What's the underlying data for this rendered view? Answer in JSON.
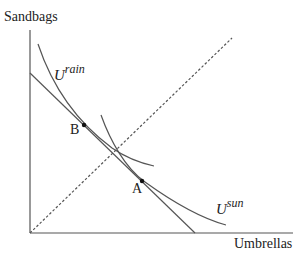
{
  "diagram": {
    "type": "indifference-curve-diagram",
    "axes": {
      "y_label": "Sandbags",
      "x_label": "Umbrellas"
    },
    "curves": [
      {
        "id": "u-rain",
        "label_base": "U",
        "label_sup": "rain"
      },
      {
        "id": "u-sun",
        "label_base": "U",
        "label_sup": "sun"
      }
    ],
    "lines": [
      {
        "id": "budget-line",
        "style": "solid"
      },
      {
        "id": "certainty-line",
        "style": "dashed"
      }
    ],
    "points": [
      {
        "id": "B",
        "label": "B"
      },
      {
        "id": "A",
        "label": "A"
      }
    ],
    "colors": {
      "axis": "#555555",
      "curve": "#555555",
      "text": "#222222",
      "point": "#111111"
    }
  }
}
